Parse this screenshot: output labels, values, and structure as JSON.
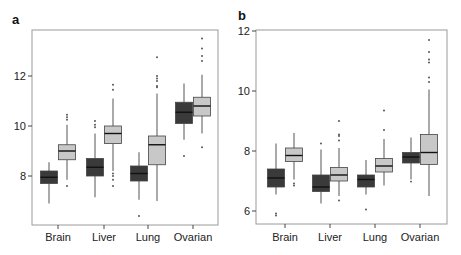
{
  "chart_data": [
    {
      "type": "boxplot",
      "panel_label": "a",
      "title": "",
      "xlabel": "",
      "ylabel": "",
      "categories": [
        "Brain",
        "Liver",
        "Lung",
        "Ovarian"
      ],
      "yticks": [
        8,
        10,
        12
      ],
      "ylim": [
        6.0,
        13.8
      ],
      "grid": false,
      "legend": null,
      "series": [
        {
          "name": "group 1 (dark)",
          "color": "#3a3a3a",
          "boxes": [
            {
              "category": "Brain",
              "whisker_low": 6.9,
              "q1": 7.7,
              "median": 7.95,
              "q3": 8.2,
              "whisker_high": 8.55,
              "outliers": []
            },
            {
              "category": "Liver",
              "whisker_low": 7.15,
              "q1": 8.0,
              "median": 8.35,
              "q3": 8.7,
              "whisker_high": 9.7,
              "outliers": [
                9.95,
                10.05,
                10.2
              ]
            },
            {
              "category": "Lung",
              "whisker_low": 7.05,
              "q1": 7.8,
              "median": 8.1,
              "q3": 8.4,
              "whisker_high": 8.95,
              "outliers": [
                6.4
              ]
            },
            {
              "category": "Ovarian",
              "whisker_low": 9.45,
              "q1": 10.1,
              "median": 10.55,
              "q3": 10.95,
              "whisker_high": 11.7,
              "outliers": [
                8.8
              ]
            }
          ]
        },
        {
          "name": "group 2 (light)",
          "color": "#c8c8c8",
          "boxes": [
            {
              "category": "Brain",
              "whisker_low": 7.85,
              "q1": 8.65,
              "median": 9.0,
              "q3": 9.25,
              "whisker_high": 10.05,
              "outliers": [
                7.6,
                10.25,
                10.35,
                10.45
              ]
            },
            {
              "category": "Liver",
              "whisker_low": 8.2,
              "q1": 9.3,
              "median": 9.7,
              "q3": 10.0,
              "whisker_high": 11.1,
              "outliers": [
                7.6,
                7.85,
                8.0,
                8.1,
                11.45,
                11.65
              ]
            },
            {
              "category": "Lung",
              "whisker_low": 7.0,
              "q1": 8.45,
              "median": 9.25,
              "q3": 9.6,
              "whisker_high": 11.3,
              "outliers": [
                11.55,
                11.6,
                11.8,
                11.9,
                12.0,
                12.75
              ]
            },
            {
              "category": "Ovarian",
              "whisker_low": 9.7,
              "q1": 10.4,
              "median": 10.8,
              "q3": 11.15,
              "whisker_high": 12.05,
              "outliers": [
                9.15,
                12.6,
                12.8,
                13.1,
                13.5
              ]
            }
          ]
        }
      ]
    },
    {
      "type": "boxplot",
      "panel_label": "b",
      "title": "",
      "xlabel": "",
      "ylabel": "",
      "categories": [
        "Brain",
        "Liver",
        "Lung",
        "Ovarian"
      ],
      "yticks": [
        6,
        8,
        10,
        12
      ],
      "ylim": [
        5.6,
        12.0
      ],
      "grid": false,
      "legend": null,
      "series": [
        {
          "name": "group 1 (dark)",
          "color": "#3a3a3a",
          "boxes": [
            {
              "category": "Brain",
              "whisker_low": 6.55,
              "q1": 6.8,
              "median": 7.1,
              "q3": 7.4,
              "whisker_high": 8.25,
              "outliers": [
                5.85,
                5.92
              ]
            },
            {
              "category": "Liver",
              "whisker_low": 6.25,
              "q1": 6.65,
              "median": 6.8,
              "q3": 7.2,
              "whisker_high": 8.05,
              "outliers": [
                8.25
              ]
            },
            {
              "category": "Lung",
              "whisker_low": 6.55,
              "q1": 6.8,
              "median": 7.05,
              "q3": 7.2,
              "whisker_high": 7.7,
              "outliers": [
                6.05
              ]
            },
            {
              "category": "Ovarian",
              "whisker_low": 7.05,
              "q1": 7.6,
              "median": 7.8,
              "q3": 7.95,
              "whisker_high": 8.45,
              "outliers": [
                6.98
              ]
            }
          ]
        },
        {
          "name": "group 2 (light)",
          "color": "#c8c8c8",
          "boxes": [
            {
              "category": "Brain",
              "whisker_low": 7.05,
              "q1": 7.65,
              "median": 7.85,
              "q3": 8.1,
              "whisker_high": 8.6,
              "outliers": [
                6.85,
                6.92
              ]
            },
            {
              "category": "Liver",
              "whisker_low": 6.5,
              "q1": 7.0,
              "median": 7.2,
              "q3": 7.45,
              "whisker_high": 8.1,
              "outliers": [
                6.35,
                8.35,
                8.5,
                8.55,
                9.0
              ]
            },
            {
              "category": "Lung",
              "whisker_low": 6.85,
              "q1": 7.3,
              "median": 7.5,
              "q3": 7.75,
              "whisker_high": 8.4,
              "outliers": [
                8.7,
                9.35
              ]
            },
            {
              "category": "Ovarian",
              "whisker_low": 6.5,
              "q1": 7.55,
              "median": 7.95,
              "q3": 8.55,
              "whisker_high": 10.05,
              "outliers": [
                10.3,
                10.45,
                10.95,
                11.05,
                11.3,
                11.7
              ]
            }
          ]
        }
      ]
    }
  ],
  "panels": [
    {
      "label": "a",
      "xlabels": [
        "Brain",
        "Liver",
        "Lung",
        "Ovarian"
      ],
      "ytick_labels": [
        "8",
        "10",
        "12"
      ]
    },
    {
      "label": "b",
      "xlabels": [
        "Brain",
        "Liver",
        "Lung",
        "Ovarian"
      ],
      "ytick_labels": [
        "6",
        "8",
        "10",
        "12"
      ]
    }
  ]
}
